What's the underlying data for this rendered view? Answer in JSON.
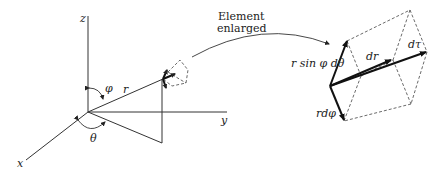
{
  "diagram": {
    "axes": {
      "x_label": "x",
      "y_label": "y",
      "z_label": "z"
    },
    "angles": {
      "polar": "φ",
      "azimuthal": "θ"
    },
    "radius_label": "r",
    "callout": {
      "line1": "Element",
      "line2": "enlarged"
    },
    "enlarged_element": {
      "theta_edge_label": "r sin φ dθ",
      "phi_edge_label": "rdφ",
      "radial_edge_label": "dr",
      "diagonal_label": "dτ"
    },
    "colors": {
      "line": "#333333",
      "background": "#ffffff"
    }
  }
}
